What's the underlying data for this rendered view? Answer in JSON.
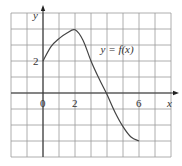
{
  "chart_data": {
    "type": "line",
    "title": "",
    "xlabel": "x",
    "ylabel": "y",
    "xlim": [
      -2,
      8
    ],
    "ylim": [
      -4,
      5
    ],
    "grid": true,
    "grid_step": 1,
    "x_tick_labels": [
      {
        "value": 0,
        "label": "0"
      },
      {
        "value": 2,
        "label": "2"
      },
      {
        "value": 6,
        "label": "6"
      }
    ],
    "y_tick_labels": [
      {
        "value": 2,
        "label": "2"
      }
    ],
    "series": [
      {
        "name": "y = f(x)",
        "x": [
          0,
          0.5,
          1,
          1.5,
          2,
          2.5,
          3,
          3.5,
          4,
          4.5,
          5,
          5.5,
          6
        ],
        "y": [
          2,
          2.9,
          3.4,
          3.75,
          3.95,
          3.3,
          2.0,
          0.9,
          -0.1,
          -1.2,
          -2.1,
          -2.75,
          -3
        ]
      }
    ],
    "annotations": [
      {
        "text": "y = f(x)",
        "x": 3.6,
        "y": 2.5
      }
    ]
  }
}
